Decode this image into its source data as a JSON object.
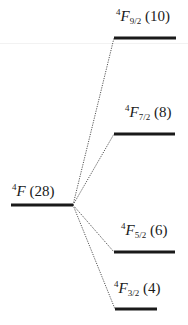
{
  "diagram": {
    "parent": {
      "mult": "4",
      "term": "F",
      "degeneracy": "(28)",
      "x1": 11,
      "x2": 73,
      "y": 205
    },
    "levels": [
      {
        "mult": "4",
        "term": "F",
        "sub": "9/2",
        "degeneracy": "(10)",
        "x1": 114,
        "x2": 176,
        "y": 38,
        "label_x": 116,
        "label_y": 8
      },
      {
        "mult": "4",
        "term": "F",
        "sub": "7/2",
        "degeneracy": "(8)",
        "x1": 114,
        "x2": 175,
        "y": 134,
        "label_x": 125,
        "label_y": 104
      },
      {
        "mult": "4",
        "term": "F",
        "sub": "5/2",
        "degeneracy": "(6)",
        "x1": 114,
        "x2": 175,
        "y": 252,
        "label_x": 121,
        "label_y": 222
      },
      {
        "mult": "4",
        "term": "F",
        "sub": "3/2",
        "degeneracy": "(4)",
        "x1": 115,
        "x2": 157,
        "y": 309,
        "label_x": 114,
        "label_y": 280
      }
    ],
    "colors": {
      "level": "#1a1a1a",
      "connector": "#555555"
    }
  }
}
